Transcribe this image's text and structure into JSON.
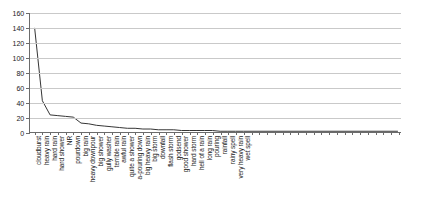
{
  "chart_data": {
    "type": "line",
    "title": "",
    "xlabel": "",
    "ylabel": "",
    "ylim": [
      0,
      160
    ],
    "yticks": [
      0,
      20,
      40,
      60,
      80,
      100,
      120,
      140,
      160
    ],
    "grid": true,
    "legend": "none",
    "line_color": "#333333",
    "grid_color": "#c9c9c9",
    "axis_color": "#6b6b6b",
    "categories": [
      "cloudburst",
      "heavy rain",
      "hard rain",
      "hard shower",
      "NR",
      "pourdown",
      "big rain",
      "heavy downpour",
      "big shower",
      "gully washer",
      "terrible rain",
      "awful rain",
      "quite a shower",
      "a-pouring down",
      "big heavy rain",
      "big storm",
      "downfall",
      "flash storm",
      "godsend",
      "good shower",
      "hard storm",
      "hell of a rain",
      "long rain",
      "pouring",
      "rainfall",
      "rainy spell",
      "very heavy rain",
      "wet spell"
    ],
    "values": [
      140,
      42,
      23,
      22,
      21,
      20,
      12,
      11,
      9,
      8,
      7,
      6,
      5,
      5,
      4,
      4,
      3,
      3,
      3,
      2,
      2,
      2,
      2,
      2,
      1,
      1,
      1,
      1
    ]
  }
}
